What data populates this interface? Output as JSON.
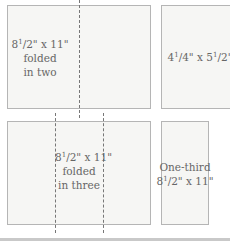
{
  "diagram": {
    "panels": [
      {
        "id": "half-fold",
        "lines": [
          "8½\" x 11\"",
          "folded",
          "in two"
        ]
      },
      {
        "id": "quarter",
        "lines": [
          "4¼\" x 5½\""
        ]
      },
      {
        "id": "tri-fold",
        "lines": [
          "8½\" x 11\"",
          "folded",
          "in three"
        ]
      },
      {
        "id": "one-third",
        "lines": [
          "One-third",
          "8½\" x 11\""
        ]
      }
    ],
    "p0": {
      "l1_whole": "8",
      "l1_frac": "1",
      "l1_rest": "/2\" x 11\"",
      "l2": "folded",
      "l3": "in two"
    },
    "p1": {
      "a_whole": "4",
      "a_frac": "1",
      "a_rest": "/4\" x 5",
      "b_frac": "1",
      "b_rest": "/2\""
    },
    "p2": {
      "l1_whole": "8",
      "l1_frac": "1",
      "l1_rest": "/2\" x 11\"",
      "l2": "folded",
      "l3": "in three"
    },
    "p3": {
      "l1": "One-third",
      "l2_whole": "8",
      "l2_frac": "1",
      "l2_rest": "/2\" x 11\""
    }
  }
}
